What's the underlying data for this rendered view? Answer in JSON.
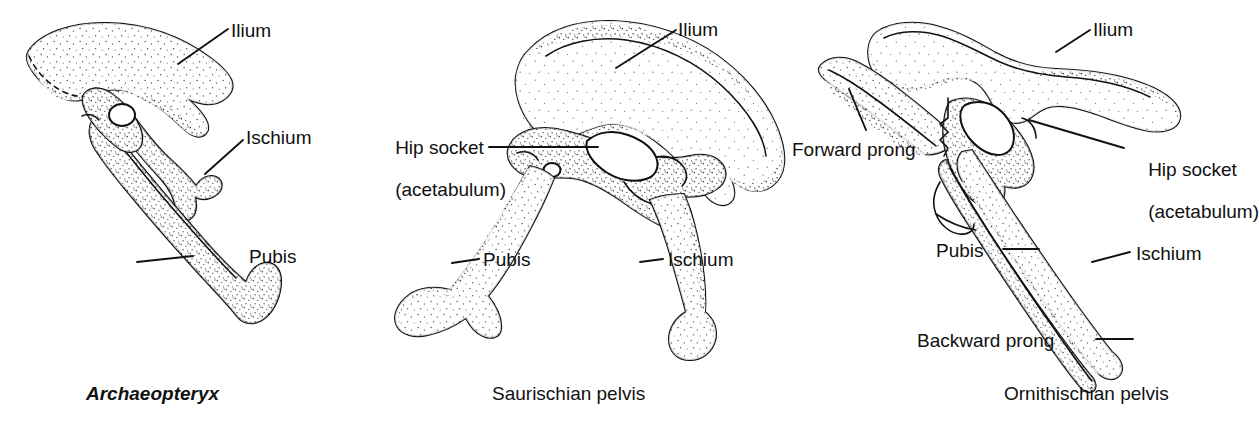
{
  "figure": {
    "kind": "scientific-line-illustration",
    "background_color": "#ffffff",
    "ink_color": "#111111",
    "panels": [
      {
        "id": "archaeopteryx",
        "caption": "Archaeopteryx",
        "caption_style": "italic",
        "labels": [
          {
            "id": "ilium",
            "text": "Ilium"
          },
          {
            "id": "ischium",
            "text": "Ischium"
          },
          {
            "id": "pubis",
            "text": "Pubis"
          }
        ]
      },
      {
        "id": "saurischian",
        "caption": "Saurischian pelvis",
        "caption_style": "roman",
        "labels": [
          {
            "id": "ilium",
            "text": "Ilium"
          },
          {
            "id": "hip-socket",
            "text": "Hip socket",
            "text_line2": "(acetabulum)"
          },
          {
            "id": "pubis",
            "text": "Pubis"
          },
          {
            "id": "ischium",
            "text": "Ischium"
          }
        ]
      },
      {
        "id": "ornithischian",
        "caption": "Ornithischian pelvis",
        "caption_style": "roman",
        "labels": [
          {
            "id": "ilium",
            "text": "Ilium"
          },
          {
            "id": "forward-prong",
            "text": "Forward prong"
          },
          {
            "id": "hip-socket",
            "text": "Hip socket",
            "text_line2": "(acetabulum)"
          },
          {
            "id": "pubis",
            "text": "Pubis"
          },
          {
            "id": "ischium",
            "text": "Ischium"
          },
          {
            "id": "backward-prong",
            "text": "Backward prong"
          }
        ]
      }
    ]
  }
}
